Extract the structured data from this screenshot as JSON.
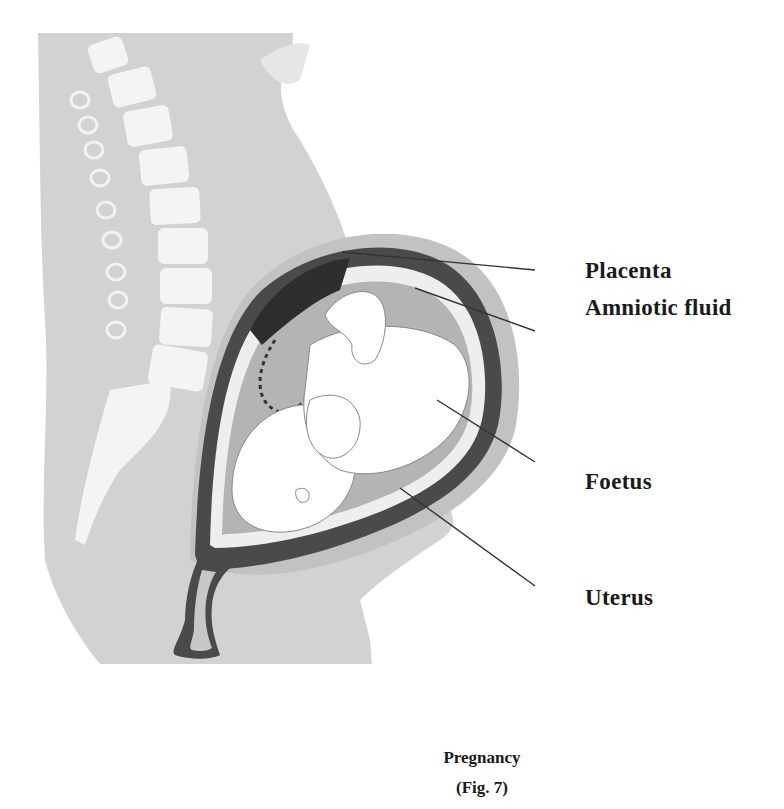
{
  "figure": {
    "title": "Pregnancy",
    "number": "(Fig. 7)",
    "labels": [
      {
        "id": "placenta",
        "text": "Placenta"
      },
      {
        "id": "amniotic-fluid",
        "text": "Amniotic fluid"
      },
      {
        "id": "foetus",
        "text": "Foetus"
      },
      {
        "id": "uterus",
        "text": "Uterus"
      }
    ],
    "colors": {
      "body": "#d2d2d2",
      "spine": "#f4f4f4",
      "uterus_wall": "#4a4a4a",
      "placenta": "#2e2e2e",
      "amniotic_fluid": "#b4b4b4",
      "foetus": "#ffffff",
      "text": "#1a1a1a"
    }
  }
}
